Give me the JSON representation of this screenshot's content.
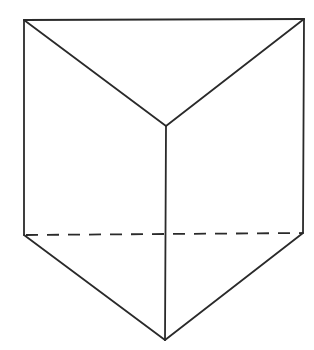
{
  "diagram": {
    "stroke_color": "#2a2a2a",
    "background": "#ffffff",
    "vertices": {
      "top_left": [
        24,
        20
      ],
      "top_right": [
        304,
        19
      ],
      "top_front": [
        166,
        126
      ],
      "bottom_left": [
        24,
        235
      ],
      "bottom_right": [
        303,
        233
      ],
      "bottom_front": [
        165,
        340
      ]
    },
    "edges": [
      {
        "from": "top_left",
        "to": "top_right",
        "style": "solid"
      },
      {
        "from": "top_left",
        "to": "top_front",
        "style": "solid"
      },
      {
        "from": "top_right",
        "to": "top_front",
        "style": "solid"
      },
      {
        "from": "top_left",
        "to": "bottom_left",
        "style": "solid"
      },
      {
        "from": "top_right",
        "to": "bottom_right",
        "style": "solid"
      },
      {
        "from": "top_front",
        "to": "bottom_front",
        "style": "solid"
      },
      {
        "from": "bottom_left",
        "to": "bottom_front",
        "style": "solid"
      },
      {
        "from": "bottom_right",
        "to": "bottom_front",
        "style": "solid"
      },
      {
        "from": "bottom_left",
        "to": "bottom_right",
        "style": "dashed"
      }
    ]
  }
}
